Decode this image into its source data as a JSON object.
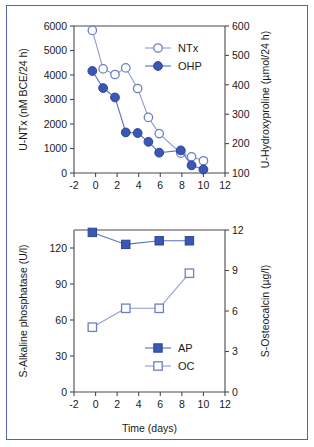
{
  "figure": {
    "border_color": "#5567a8",
    "background": "#ffffff",
    "marker_fill_color": "#3b57b5",
    "marker_open_stroke_color": "#6d7fc4",
    "line_color": "#5a6fbf"
  },
  "chart_data": [
    {
      "type": "line",
      "panel": "top",
      "title": "",
      "xlabel": "",
      "ylabel": "U-NTx (nM BCE/24 h)",
      "y2label": "U-Hydroxyproline (µmol/24 h)",
      "xlim": [
        -2,
        12
      ],
      "xticks": [
        -2,
        0,
        2,
        4,
        6,
        8,
        10,
        12
      ],
      "xticklabels": [
        "-2",
        "0",
        "2",
        "4",
        "6",
        "8",
        "10",
        "12"
      ],
      "ylim": [
        0,
        6000
      ],
      "yticks": [
        0,
        1000,
        2000,
        3000,
        4000,
        5000,
        6000
      ],
      "yticklabels": [
        "0",
        "1000",
        "2000",
        "3000",
        "4000",
        "5000",
        "6000"
      ],
      "y2lim": [
        100,
        600
      ],
      "y2ticks": [
        100,
        200,
        300,
        400,
        500,
        600
      ],
      "y2ticklabels": [
        "100",
        "200",
        "300",
        "400",
        "500",
        "600"
      ],
      "grid": false,
      "legend_position": "top-right",
      "series": [
        {
          "name": "NTx",
          "axis": "left",
          "marker": "open-circle",
          "x": [
            -0.3,
            0.7,
            1.8,
            2.8,
            3.9,
            4.9,
            5.9,
            7.9,
            8.9,
            10.0
          ],
          "values": [
            5820,
            4250,
            4020,
            4290,
            3450,
            2270,
            1610,
            810,
            660,
            500
          ]
        },
        {
          "name": "OHP",
          "axis": "right",
          "marker": "filled-circle",
          "x": [
            -0.3,
            0.7,
            1.8,
            2.8,
            3.9,
            4.9,
            5.9,
            7.9,
            8.9,
            10.0
          ],
          "values": [
            447,
            389,
            357,
            238,
            236,
            206,
            169,
            177,
            126,
            112
          ]
        }
      ],
      "legend": [
        {
          "label": "NTx",
          "marker": "open-circle"
        },
        {
          "label": "OHP",
          "marker": "filled-circle"
        }
      ]
    },
    {
      "type": "line",
      "panel": "bottom",
      "title": "",
      "xlabel": "Time (days)",
      "ylabel": "S-Alkaline phosphatase (U/l)",
      "y2label": "S-Osteocalcin (µg/l)",
      "xlim": [
        -2,
        12
      ],
      "xticks": [
        -2,
        0,
        2,
        4,
        6,
        8,
        10,
        12
      ],
      "xticklabels": [
        "-2",
        "0",
        "2",
        "4",
        "6",
        "8",
        "10",
        "12"
      ],
      "ylim": [
        0,
        135
      ],
      "yticks": [
        0,
        30,
        60,
        90,
        120
      ],
      "yticklabels": [
        "0",
        "30",
        "60",
        "90",
        "120"
      ],
      "y2lim": [
        0,
        12
      ],
      "y2ticks": [
        0,
        3,
        6,
        9,
        12
      ],
      "y2ticklabels": [
        "0",
        "3",
        "6",
        "9",
        "12"
      ],
      "grid": false,
      "legend_position": "bottom-right",
      "series": [
        {
          "name": "AP",
          "axis": "left",
          "marker": "filled-square",
          "x": [
            -0.3,
            2.8,
            5.9,
            8.7
          ],
          "values": [
            133,
            123,
            126,
            126
          ]
        },
        {
          "name": "OC",
          "axis": "right",
          "marker": "open-square",
          "x": [
            -0.3,
            2.8,
            5.9,
            8.7
          ],
          "values": [
            4.8,
            6.2,
            6.2,
            8.8
          ]
        }
      ],
      "legend": [
        {
          "label": "AP",
          "marker": "filled-square"
        },
        {
          "label": "OC",
          "marker": "open-square"
        }
      ]
    }
  ]
}
